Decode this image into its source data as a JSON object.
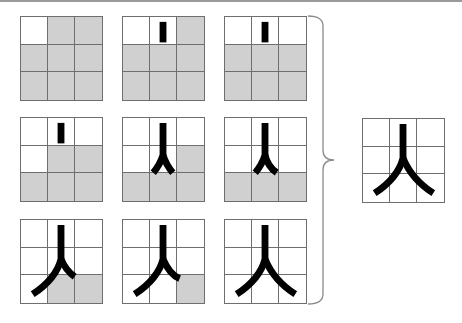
{
  "figure": {
    "character": "人",
    "colors": {
      "shade": "#d0d0d0",
      "gridline": "#6e6e6e",
      "stroke": "#000000",
      "bracket": "#8a8a8a"
    },
    "steps": [
      {
        "step": 1,
        "stage": 0,
        "shaded": [
          1,
          2,
          3,
          4,
          5,
          6,
          7,
          8
        ]
      },
      {
        "step": 2,
        "stage": 1,
        "shaded": [
          2,
          3,
          4,
          5,
          6,
          7,
          8
        ]
      },
      {
        "step": 3,
        "stage": 2,
        "shaded": [
          3,
          4,
          5,
          6,
          7,
          8
        ]
      },
      {
        "step": 4,
        "stage": 3,
        "shaded": [
          4,
          5,
          6,
          7,
          8
        ]
      },
      {
        "step": 5,
        "stage": 4,
        "shaded": [
          5,
          6,
          7,
          8
        ]
      },
      {
        "step": 6,
        "stage": 5,
        "shaded": [
          6,
          7,
          8
        ]
      },
      {
        "step": 7,
        "stage": 6,
        "shaded": [
          7,
          8
        ]
      },
      {
        "step": 8,
        "stage": 7,
        "shaded": [
          8
        ]
      },
      {
        "step": 9,
        "stage": 8,
        "shaded": []
      }
    ],
    "result": {
      "stage": 8,
      "shaded": []
    }
  }
}
